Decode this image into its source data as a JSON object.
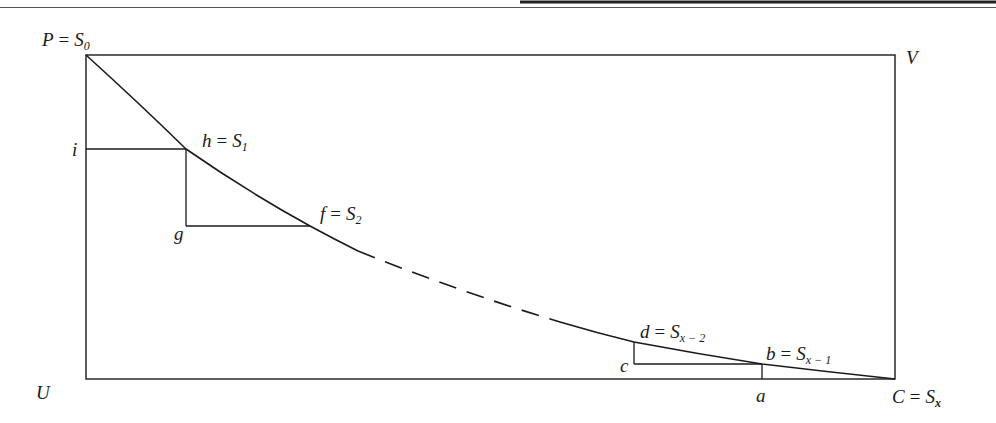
{
  "figure": {
    "colors": {
      "ink": "#1a1a1a",
      "background": "#ffffff"
    },
    "rectangle": {
      "x1": 86,
      "y1": 55,
      "x2": 895,
      "y2": 379
    },
    "labels": {
      "P": {
        "var": "P",
        "eq": "=",
        "sym": "S",
        "sub": "0"
      },
      "V": {
        "var": "V"
      },
      "U": {
        "var": "U"
      },
      "C": {
        "var": "C",
        "eq": "=",
        "sym": "S",
        "sub": "x"
      },
      "h": {
        "var": "h",
        "eq": "=",
        "sym": "S",
        "sub": "1"
      },
      "f": {
        "var": "f",
        "eq": "=",
        "sym": "S",
        "sub": "2"
      },
      "d": {
        "var": "d",
        "eq": "=",
        "sym": "S",
        "sub": "x − 2"
      },
      "b": {
        "var": "b",
        "eq": "=",
        "sym": "S",
        "sub": "x − 1"
      },
      "i": {
        "var": "i"
      },
      "g": {
        "var": "g"
      },
      "c": {
        "var": "c"
      },
      "a": {
        "var": "a"
      }
    },
    "points": {
      "P": [
        86,
        55
      ],
      "h": [
        186,
        149
      ],
      "f": [
        310,
        226
      ],
      "dash_start": [
        358,
        251
      ],
      "dash_end": [
        560,
        322
      ],
      "d": [
        634,
        342
      ],
      "b": [
        762,
        364
      ],
      "C": [
        895,
        379
      ],
      "i": [
        86,
        149
      ],
      "g": [
        186,
        226
      ],
      "c": [
        634,
        364
      ],
      "a": [
        762,
        379
      ]
    }
  }
}
